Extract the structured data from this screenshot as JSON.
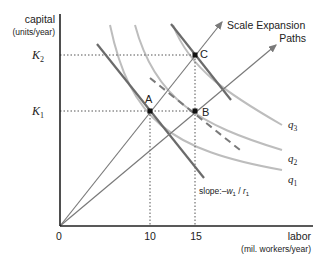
{
  "diagram": {
    "y_axis": {
      "label": "capital",
      "unit": "(units/year)",
      "ticks": [
        {
          "base": "K",
          "sub": "2"
        },
        {
          "base": "K",
          "sub": "1"
        }
      ]
    },
    "x_axis": {
      "label": "labor",
      "unit": "(mil. workers/year)",
      "ticks": [
        "0",
        "10",
        "15"
      ]
    },
    "points": [
      {
        "id": "A",
        "label": "A"
      },
      {
        "id": "B",
        "label": "B"
      },
      {
        "id": "C",
        "label": "C"
      }
    ],
    "isoquants": [
      {
        "base": "q",
        "sub": "3"
      },
      {
        "base": "q",
        "sub": "2"
      },
      {
        "base": "q",
        "sub": "1"
      }
    ],
    "expansion_label_line1": "Scale Expansion",
    "expansion_label_line2": "Paths",
    "slope_label_prefix": "slope:–",
    "slope_w": "w",
    "slope_w_sub": "1",
    "slope_sep": " / ",
    "slope_r": "r",
    "slope_r_sub": "1",
    "colors": {
      "axis": "#222222",
      "isocost": "#6b6b6b",
      "isoquant": "#b8b8b8",
      "path": "#7a7a7a",
      "guide": "#555555"
    }
  }
}
